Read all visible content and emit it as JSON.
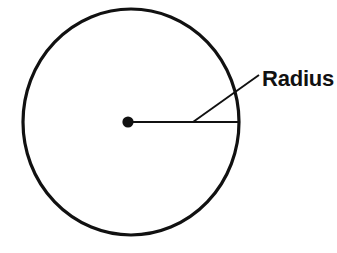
{
  "figure": {
    "background_color": "#ffffff",
    "stroke_color": "#111111",
    "labels": {
      "radius": "Radius"
    },
    "geometry": {
      "circle": {
        "center_x": 131,
        "center_y": 122,
        "radius_x": 108,
        "radius_y": 113,
        "stroke_width": 3.2
      },
      "center_dot": {
        "cx": 128,
        "cy": 122,
        "r": 5.6
      },
      "radius_line": {
        "x1": 128,
        "y1": 122,
        "x2": 239,
        "y2": 122,
        "stroke_width": 1.9
      },
      "leader_line": {
        "x1": 193,
        "y1": 122,
        "x2": 259,
        "y2": 75,
        "stroke_width": 1.9
      },
      "label_position": {
        "x": 262,
        "y": 86
      }
    }
  }
}
